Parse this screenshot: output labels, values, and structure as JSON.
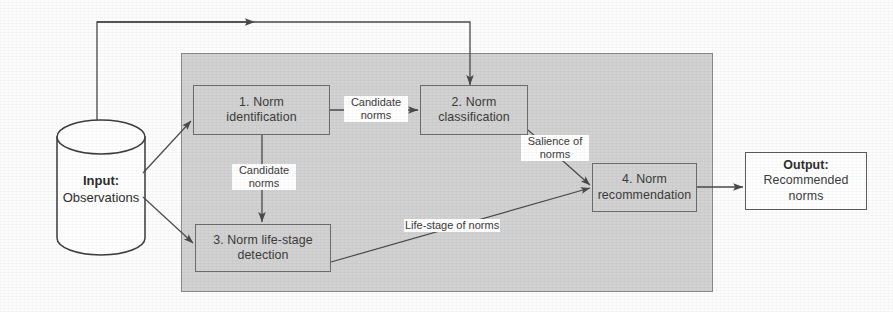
{
  "diagram": {
    "colors": {
      "container_fill": "#d2d2d2",
      "box_fill": "#d2d2d2",
      "box_stroke": "#6d6d6d",
      "output_fill": "#ffffff",
      "output_stroke": "#5d5d5d",
      "line": "#4a4a4a",
      "background": "#fdfdfd",
      "text": "#3b3b3b"
    },
    "input": {
      "title": "Input:",
      "subtitle": "Observations"
    },
    "output": {
      "title": "Output:",
      "line1": "Recommended",
      "line2": "norms"
    },
    "steps": [
      {
        "id": "step1",
        "line1": "1. Norm",
        "line2": "identification"
      },
      {
        "id": "step2",
        "line1": "2. Norm",
        "line2": "classification"
      },
      {
        "id": "step3",
        "line1": "3. Norm life-stage",
        "line2": "detection"
      },
      {
        "id": "step4",
        "line1": "4. Norm",
        "line2": "recommendation"
      }
    ],
    "edge_labels": [
      {
        "id": "candidate_norms_1",
        "line1": "Candidate",
        "line2": "norms"
      },
      {
        "id": "candidate_norms_2",
        "line1": "Candidate",
        "line2": "norms"
      },
      {
        "id": "salience_of_norms",
        "line1": "Salience of",
        "line2": "norms"
      },
      {
        "id": "life_stage_of_norms",
        "line1": "Life-stage of norms",
        "line2": ""
      }
    ]
  }
}
